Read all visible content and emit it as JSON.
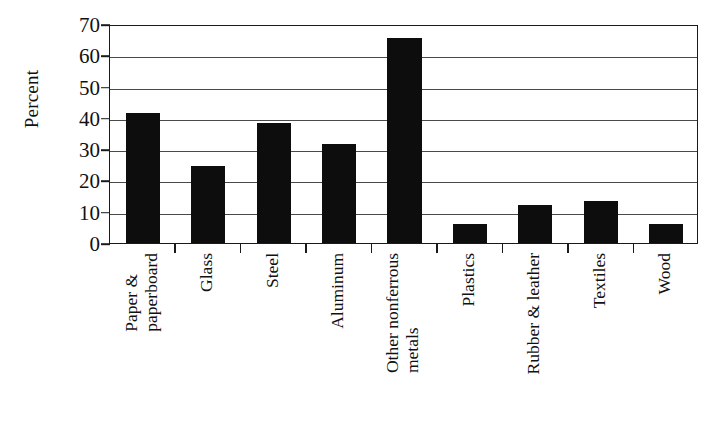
{
  "chart_data": {
    "type": "bar",
    "title": "",
    "subtitle": "",
    "xlabel": "",
    "ylabel": "Percent",
    "ylim": [
      0,
      70
    ],
    "ytick_step": 10,
    "yticks": [
      70,
      60,
      50,
      40,
      30,
      20,
      10,
      0
    ],
    "ytick_labels": [
      "70",
      "60",
      "50",
      "40",
      "30",
      "20",
      "10",
      "0"
    ],
    "grid": true,
    "grid_axis": "y",
    "legend": null,
    "legend_position": "none",
    "bar_color": "#0d0d0d",
    "categories": [
      "Paper & paperboard",
      "Glass",
      "Steel",
      "Aluminum",
      "Other nonferrous metals",
      "Plastics",
      "Rubber & leather",
      "Textiles",
      "Wood"
    ],
    "category_label_lines": [
      [
        "Paper &",
        "paperboard"
      ],
      [
        "Glass"
      ],
      [
        "Steel"
      ],
      [
        "Aluminum"
      ],
      [
        "Other nonferrous",
        "metals"
      ],
      [
        "Plastics"
      ],
      [
        "Rubber & leather"
      ],
      [
        "Textiles"
      ],
      [
        "Wood"
      ]
    ],
    "values": [
      41.5,
      24.5,
      38.5,
      31.5,
      65.5,
      6,
      12,
      13.5,
      6
    ],
    "series": [
      {
        "name": "Percent",
        "values": [
          41.5,
          24.5,
          38.5,
          31.5,
          65.5,
          6,
          12,
          13.5,
          6
        ]
      }
    ],
    "annotations": []
  },
  "axis": {
    "y_title": "Percent"
  }
}
